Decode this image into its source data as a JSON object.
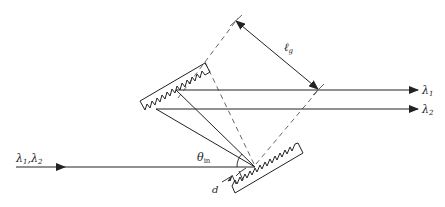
{
  "diagram": {
    "type": "grating-pair-dispersion",
    "labels": {
      "input_beam": "λ1, λ2",
      "input_l1": "λ",
      "input_s1": "1",
      "input_comma": ",",
      "input_l2": "λ",
      "input_s2": "2",
      "output_1_l": "λ",
      "output_1_s": "1",
      "output_2_l": "λ",
      "output_2_s": "2",
      "angle_theta": "θ",
      "angle_sub": "in",
      "separation_l": "ℓ",
      "separation_sub": "g",
      "groove_period": "d"
    },
    "elements": [
      {
        "name": "grating-1",
        "description": "upper-left tilted diffraction grating"
      },
      {
        "name": "grating-2",
        "description": "lower-right tilted diffraction grating"
      },
      {
        "name": "input-beam",
        "description": "incoming beam with wavelengths λ1, λ2"
      },
      {
        "name": "output-beam-1",
        "description": "outgoing beam λ1"
      },
      {
        "name": "output-beam-2",
        "description": "outgoing beam λ2"
      },
      {
        "name": "separation-arrow",
        "description": "perpendicular grating separation ℓg"
      },
      {
        "name": "incidence-angle",
        "description": "angle of incidence θin"
      },
      {
        "name": "groove-spacing",
        "description": "grating groove period d"
      }
    ],
    "colors": {
      "line": "#222222",
      "dashed": "#555555",
      "background": "#ffffff"
    }
  }
}
